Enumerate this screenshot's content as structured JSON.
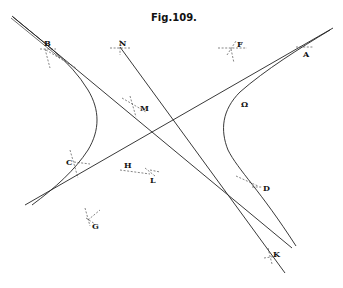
{
  "figure": {
    "title": "Fig.109.",
    "background": "#ffffff",
    "ink_color": "#222222",
    "labels": {
      "B": "B",
      "N": "N",
      "F": "F",
      "A": "A",
      "M": "M",
      "Omega": "Ω",
      "C": "C",
      "H": "H",
      "L": "L",
      "D": "D",
      "G": "G",
      "K": "K"
    },
    "points": [
      {
        "id": "B",
        "x": 45,
        "y": 49
      },
      {
        "id": "N",
        "x": 120,
        "y": 47
      },
      {
        "id": "F",
        "x": 232,
        "y": 48
      },
      {
        "id": "A",
        "x": 305,
        "y": 47
      },
      {
        "id": "M",
        "x": 133,
        "y": 105
      },
      {
        "id": "Omega",
        "x": 238,
        "y": 98
      },
      {
        "id": "C",
        "x": 75,
        "y": 162
      },
      {
        "id": "H",
        "x": 128,
        "y": 170
      },
      {
        "id": "L",
        "x": 150,
        "y": 174
      },
      {
        "id": "D",
        "x": 260,
        "y": 187
      },
      {
        "id": "G",
        "x": 89,
        "y": 220
      },
      {
        "id": "K",
        "x": 272,
        "y": 256
      }
    ],
    "elements": [
      {
        "type": "asymptote",
        "from": [
          12,
          16
        ],
        "to": [
          292,
          248
        ]
      },
      {
        "type": "asymptote",
        "from": [
          25,
          205
        ],
        "to": [
          333,
          28
        ]
      },
      {
        "type": "hyperbola-branch",
        "side": "left",
        "through": [
          "B",
          "C"
        ]
      },
      {
        "type": "hyperbola-branch",
        "side": "right",
        "through": [
          "A",
          "Omega",
          "D"
        ]
      },
      {
        "type": "line",
        "through": [
          "N",
          "K"
        ]
      }
    ]
  }
}
